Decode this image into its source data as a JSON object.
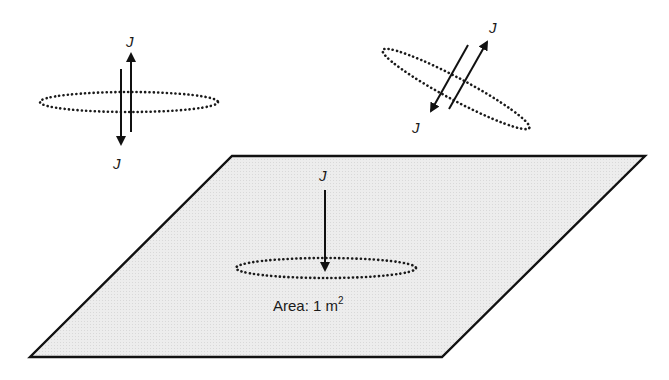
{
  "figure": {
    "colors": {
      "background": "#ffffff",
      "plane_fill": "#ececec",
      "stroke": "#111111"
    }
  },
  "loop_horizontal": {
    "label_top": "J",
    "label_bottom": "J",
    "arrows": [
      "up",
      "down"
    ]
  },
  "loop_tilted": {
    "label_top": "J",
    "label_bottom": "J",
    "arrows": [
      "up-right",
      "down-left"
    ]
  },
  "plane": {
    "current_label": "J",
    "area_label": "Area: 1 m",
    "area_superscript": "2",
    "arrow": "down"
  }
}
